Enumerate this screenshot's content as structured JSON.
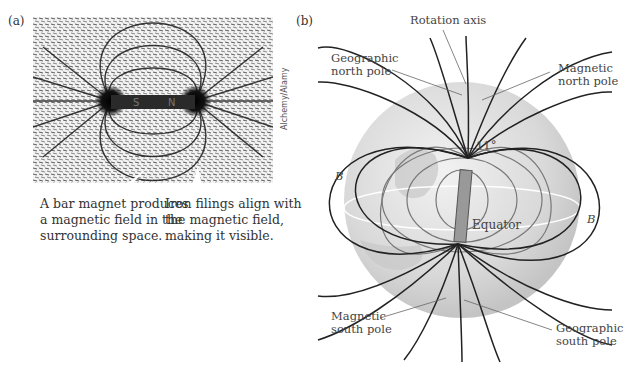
{
  "panel_a": {
    "label": "(a)",
    "photo_description": "iron filings around bar magnet",
    "magnet_poles": [
      "S",
      "N"
    ],
    "caption_left": [
      "A bar magnet produces",
      "a magnetic field in the",
      "surrounding space."
    ],
    "caption_right": [
      "Iron filings align with",
      "the magnetic field,",
      "making it visible."
    ],
    "credit": "Alchemy/Alamy"
  },
  "panel_b": {
    "label": "(b)",
    "rotation_axis": "Rotation axis",
    "geographic_north": [
      "Geographic",
      "north pole"
    ],
    "magnetic_north": [
      "Magnetic",
      "north pole"
    ],
    "angle": "11°",
    "equator": "Equator",
    "field_symbol": "B",
    "magnetic_south": [
      "Magnetic",
      "south pole"
    ],
    "geographic_south": [
      "Geographic",
      "south pole"
    ]
  }
}
